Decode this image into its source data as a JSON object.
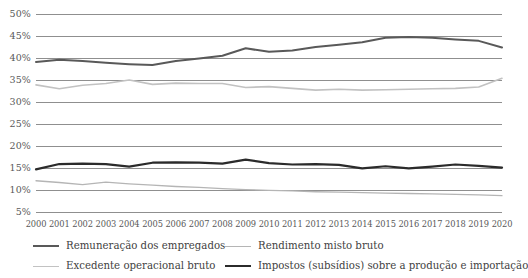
{
  "chart_data": {
    "type": "line",
    "title": "",
    "subtitle": "",
    "xlabel": "",
    "ylabel": "",
    "grid": true,
    "legend_position": "bottom",
    "ylim": [
      5,
      50
    ],
    "ytick_step": 5,
    "ytick_labels": [
      "50%",
      "45%",
      "40%",
      "35%",
      "30%",
      "25%",
      "20%",
      "15%",
      "10%",
      "5%"
    ],
    "ytick_values": [
      50,
      45,
      40,
      35,
      30,
      25,
      20,
      15,
      10,
      5
    ],
    "categories": [
      "2000",
      "2001",
      "2002",
      "2003",
      "2004",
      "2005",
      "2006",
      "2007",
      "2008",
      "2009",
      "2010",
      "2011",
      "2012",
      "2013",
      "2014",
      "2015",
      "2016",
      "2017",
      "2018",
      "2019",
      "2020"
    ],
    "x": [
      2000,
      2001,
      2002,
      2003,
      2004,
      2005,
      2006,
      2007,
      2008,
      2009,
      2010,
      2011,
      2012,
      2013,
      2014,
      2015,
      2016,
      2017,
      2018,
      2019,
      2020
    ],
    "series": [
      {
        "name": "Remuneração dos empregados",
        "color": "#595959",
        "width": 2.0,
        "values": [
          39.1,
          39.6,
          39.3,
          38.9,
          38.6,
          38.4,
          39.3,
          39.9,
          40.5,
          42.2,
          41.4,
          41.7,
          42.5,
          43.0,
          43.6,
          44.6,
          44.8,
          44.6,
          44.2,
          43.9,
          42.4
        ]
      },
      {
        "name": "Rendimento misto bruto",
        "color": "#b5b5b5",
        "width": 1.3,
        "values": [
          12.1,
          11.7,
          11.2,
          11.8,
          11.4,
          11.1,
          10.8,
          10.6,
          10.3,
          10.1,
          9.9,
          9.8,
          9.6,
          9.5,
          9.4,
          9.3,
          9.2,
          9.1,
          9.0,
          8.9,
          8.7
        ]
      },
      {
        "name": "Excedente operacional bruto",
        "color": "#c2c2c2",
        "width": 1.6,
        "values": [
          33.9,
          33.0,
          33.8,
          34.2,
          35.0,
          34.0,
          34.3,
          34.2,
          34.2,
          33.3,
          33.5,
          33.1,
          32.7,
          32.9,
          32.7,
          32.8,
          32.9,
          33.0,
          33.1,
          33.4,
          35.4
        ]
      },
      {
        "name": "Impostos (subsídios) sobre a produção e importação",
        "color": "#2b2b2b",
        "width": 2.2,
        "values": [
          14.7,
          15.9,
          16.0,
          15.9,
          15.3,
          16.2,
          16.3,
          16.2,
          16.0,
          16.9,
          16.1,
          15.8,
          15.9,
          15.7,
          14.9,
          15.4,
          14.9,
          15.3,
          15.8,
          15.5,
          15.1
        ]
      }
    ]
  },
  "legend": {
    "items": [
      {
        "label": "Remuneração dos empregados",
        "color": "#595959",
        "width": 2.4
      },
      {
        "label": "Rendimento misto bruto",
        "color": "#b5b5b5",
        "width": 1.8
      },
      {
        "label": "Excedente operacional bruto",
        "color": "#c2c2c2",
        "width": 1.8
      },
      {
        "label": "Impostos (subsídios) sobre a produção e importação",
        "color": "#2b2b2b",
        "width": 2.6
      }
    ]
  },
  "axis_style": {
    "gridline_color": "#8f8f8f",
    "tick_color": "#595959"
  }
}
